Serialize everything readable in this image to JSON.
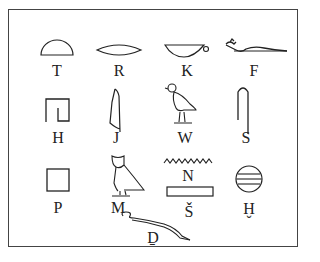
{
  "diagram": {
    "rows": [
      [
        {
          "sign": "bread-loaf",
          "label": "T"
        },
        {
          "sign": "mouth",
          "label": "R"
        },
        {
          "sign": "basket-with-handle",
          "label": "K"
        },
        {
          "sign": "horned-viper",
          "label": "F"
        }
      ],
      [
        {
          "sign": "courtyard",
          "label": "H"
        },
        {
          "sign": "cobra",
          "label": "J"
        },
        {
          "sign": "quail-chick",
          "label": "W"
        },
        {
          "sign": "folded-cloth",
          "label": "S"
        }
      ],
      [
        {
          "sign": "stool",
          "label": "P"
        },
        {
          "sign": "owl",
          "label": "M"
        },
        {
          "sign": "water-ripple",
          "label": "N"
        },
        {
          "sign": "pool",
          "label": "Š"
        },
        {
          "sign": "placenta",
          "label": "Ḫ"
        }
      ],
      [
        {
          "sign": "cobra-snake",
          "label": "Ḏ"
        }
      ]
    ]
  }
}
